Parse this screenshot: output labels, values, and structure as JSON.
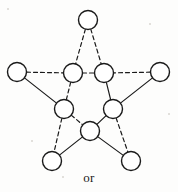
{
  "figure": {
    "name": "pentagram-graph-figure",
    "caption": "or",
    "background_color": "#fdfdfc",
    "stroke_color": "#1a1a1a",
    "node_fill": "#ffffff",
    "node_radius": 9.5,
    "node_stroke_width": 1.4,
    "edge_stroke_width": 1.2,
    "dash_pattern": "4,3",
    "width": 178,
    "height": 192
  },
  "graph": {
    "description": "Pentagram (5-point star) drawn as a graph with 10 circular vertices: 5 outer points and 5 inner pentagon vertices. Edges alternate between dashed and solid styles.",
    "node_count": 10,
    "edge_count": 15,
    "nodes": [
      {
        "id": "top",
        "label": "top-vertex",
        "cx": 88,
        "cy": 20
      },
      {
        "id": "left-outer",
        "label": "left-outer-vertex",
        "cx": 17,
        "cy": 72
      },
      {
        "id": "right-outer",
        "label": "right-outer-vertex",
        "cx": 160,
        "cy": 72
      },
      {
        "id": "bottom-left",
        "label": "bottom-left-outer-vertex",
        "cx": 52,
        "cy": 161
      },
      {
        "id": "bottom-right",
        "label": "bottom-right-outer-vertex",
        "cx": 131,
        "cy": 161
      },
      {
        "id": "inner-tl",
        "label": "inner-top-left-vertex",
        "cx": 73,
        "cy": 73
      },
      {
        "id": "inner-tr",
        "label": "inner-top-right-vertex",
        "cx": 104,
        "cy": 73
      },
      {
        "id": "inner-l",
        "label": "inner-left-vertex",
        "cx": 64,
        "cy": 109
      },
      {
        "id": "inner-r",
        "label": "inner-right-vertex",
        "cx": 113,
        "cy": 109
      },
      {
        "id": "inner-b",
        "label": "inner-bottom-vertex",
        "cx": 90,
        "cy": 131
      }
    ],
    "edges": [
      {
        "id": "e1",
        "from": "top",
        "to": "inner-tl",
        "style": "dashed"
      },
      {
        "id": "e2",
        "from": "top",
        "to": "inner-tr",
        "style": "dashed"
      },
      {
        "id": "e3",
        "from": "left-outer",
        "to": "inner-tl",
        "style": "dashed"
      },
      {
        "id": "e4",
        "from": "left-outer",
        "to": "inner-l",
        "style": "solid"
      },
      {
        "id": "e5",
        "from": "right-outer",
        "to": "inner-tr",
        "style": "dashed"
      },
      {
        "id": "e6",
        "from": "right-outer",
        "to": "inner-r",
        "style": "solid"
      },
      {
        "id": "e7",
        "from": "inner-tl",
        "to": "inner-tr",
        "style": "dashed"
      },
      {
        "id": "e8",
        "from": "inner-tl",
        "to": "inner-l",
        "style": "dashed"
      },
      {
        "id": "e9",
        "from": "inner-tr",
        "to": "inner-r",
        "style": "solid"
      },
      {
        "id": "e10",
        "from": "inner-l",
        "to": "inner-b",
        "style": "dashed"
      },
      {
        "id": "e11",
        "from": "inner-r",
        "to": "inner-b",
        "style": "solid"
      },
      {
        "id": "e12",
        "from": "inner-l",
        "to": "bottom-left",
        "style": "dashed"
      },
      {
        "id": "e13",
        "from": "inner-r",
        "to": "bottom-right",
        "style": "dashed"
      },
      {
        "id": "e14",
        "from": "inner-b",
        "to": "bottom-left",
        "style": "solid"
      },
      {
        "id": "e15",
        "from": "inner-b",
        "to": "bottom-right",
        "style": "solid"
      }
    ]
  }
}
